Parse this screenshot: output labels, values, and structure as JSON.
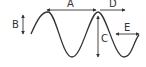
{
  "diagram": {
    "type": "wave-dimension-diagram",
    "stroke_color": "#333333",
    "background": "#ffffff",
    "labels": {
      "A": "A",
      "B": "B",
      "C": "C",
      "D": "D",
      "E": "E"
    },
    "dimensions": [
      {
        "id": "A",
        "meaning": "horizontal distance peak to peak",
        "orientation": "horizontal",
        "arrows": "double"
      },
      {
        "id": "B",
        "meaning": "vertical offset at wave start",
        "orientation": "vertical",
        "arrows": "double"
      },
      {
        "id": "C",
        "meaning": "vertical distance peak to trough",
        "orientation": "vertical",
        "arrows": "double"
      },
      {
        "id": "D",
        "meaning": "horizontal distance from peak",
        "orientation": "horizontal",
        "arrows": "single-right"
      },
      {
        "id": "E",
        "meaning": "horizontal width in trough",
        "orientation": "horizontal",
        "arrows": "double"
      }
    ]
  }
}
